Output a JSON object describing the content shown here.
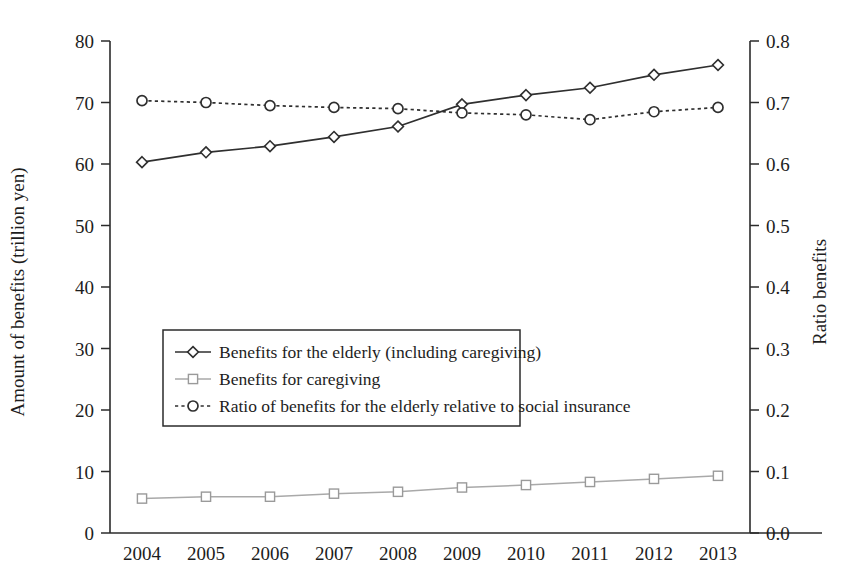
{
  "chart_data": {
    "type": "line",
    "title": "",
    "xlabel": "",
    "ylabel": "Amount of benefits (trillion yen)",
    "y2label": "Ratio benefits",
    "grid": false,
    "legend_position": "center-left inside plot",
    "categories": [
      "2004",
      "2005",
      "2006",
      "2007",
      "2008",
      "2009",
      "2010",
      "2011",
      "2012",
      "2013"
    ],
    "x": [
      2004,
      2005,
      2006,
      2007,
      2008,
      2009,
      2010,
      2011,
      2012,
      2013
    ],
    "ylim": [
      0,
      80
    ],
    "yticks": [
      0,
      10,
      20,
      30,
      40,
      50,
      60,
      70,
      80
    ],
    "ytick_labels": [
      "0",
      "10",
      "20",
      "30",
      "40",
      "50",
      "60",
      "70",
      "80"
    ],
    "y2lim": [
      0.0,
      0.8
    ],
    "y2ticks": [
      0.0,
      0.1,
      0.2,
      0.3,
      0.4,
      0.5,
      0.6,
      0.7,
      0.8
    ],
    "y2tick_labels": [
      "0.0",
      "0.1",
      "0.2",
      "0.3",
      "0.4",
      "0.5",
      "0.6",
      "0.7",
      "0.8"
    ],
    "series": [
      {
        "name": "Benefits for the elderly (including caregiving)",
        "axis": "left",
        "marker": "diamond",
        "linestyle": "solid",
        "color": "#2f2f2f",
        "values": [
          60.3,
          61.9,
          62.9,
          64.4,
          66.1,
          69.7,
          71.2,
          72.4,
          74.5,
          76.1
        ]
      },
      {
        "name": "Benefits for caregiving",
        "axis": "left",
        "marker": "square",
        "linestyle": "solid",
        "color": "#a9a9a9",
        "values": [
          5.6,
          5.9,
          5.9,
          6.4,
          6.7,
          7.4,
          7.8,
          8.3,
          8.8,
          9.3
        ]
      },
      {
        "name": "Ratio of benefits for the elderly relative to social insurance",
        "axis": "right",
        "marker": "circle",
        "linestyle": "dotted",
        "color": "#2f2f2f",
        "values": [
          0.703,
          0.7,
          0.695,
          0.692,
          0.69,
          0.683,
          0.68,
          0.672,
          0.685,
          0.692
        ]
      }
    ]
  },
  "legend": {
    "items": [
      {
        "label": "Benefits for the elderly (including caregiving)",
        "marker": "diamond",
        "linestyle": "solid"
      },
      {
        "label": "Benefits for caregiving",
        "marker": "square",
        "linestyle": "solid"
      },
      {
        "label": "Ratio of benefits for the elderly relative to social insurance",
        "marker": "circle",
        "linestyle": "dotted"
      }
    ]
  }
}
